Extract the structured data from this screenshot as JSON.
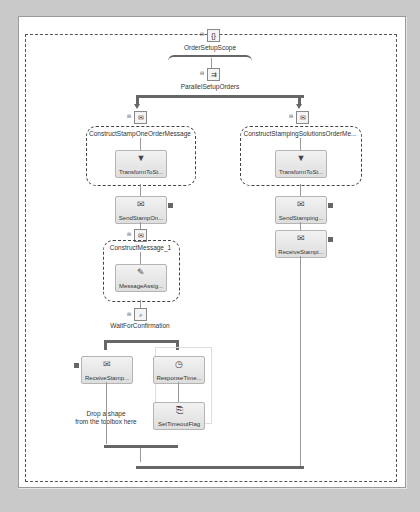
{
  "orchestration": {
    "scope": {
      "label": "OrderSetupScope"
    },
    "parallel": {
      "label": "ParallelSetupOrders"
    },
    "left_branch": {
      "construct1": {
        "label": "ConstructStampOneOrderMessage",
        "transform": "TransformToSt..."
      },
      "send": "SendStampOn...",
      "construct2": {
        "label": "ConstructMessage_1",
        "assign": "MessageAssig..."
      },
      "listen": {
        "label": "WaitForConfirmation"
      },
      "listen_left": {
        "receive": "ReceiveStamp...",
        "drop_hint_1": "Drop a shape",
        "drop_hint_2": "from the toolbox here"
      },
      "listen_right": {
        "delay": "ResponseTime...",
        "expression": "SetTimeoutFlag"
      }
    },
    "right_branch": {
      "construct": {
        "label": "ConstructStampingSolutionsOrderMe...",
        "transform": "TransformToSt..."
      },
      "send": "SendStamping...",
      "receive": "ReceiveStampi..."
    }
  }
}
